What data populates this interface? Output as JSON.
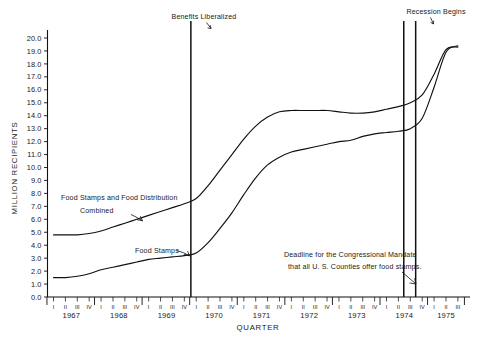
{
  "chart_data": {
    "type": "line",
    "title": "",
    "xlabel": "QUARTER",
    "ylabel": "MILLION RECIPIENTS",
    "ylim": [
      0.0,
      20.0
    ],
    "ytick_step": 1.0,
    "grid": false,
    "legend_position": "inline-annotations",
    "ytick_labels": [
      "0.0",
      "1.0",
      "2.0",
      "3.0",
      "4.0",
      "5.0",
      "6.0",
      "7.0",
      "8.0",
      "9.0",
      "10.0",
      "11.0",
      "12.0",
      "13.0",
      "14.0",
      "15.0",
      "16.0",
      "17.0",
      "18.0",
      "19.0",
      "20.0"
    ],
    "years": [
      "1967",
      "1968",
      "1969",
      "1970",
      "1971",
      "1972",
      "1973",
      "1974",
      "1975"
    ],
    "quarter_labels": [
      "I",
      "II",
      "III",
      "IV"
    ],
    "last_year_quarters": [
      "I",
      "II",
      "III"
    ],
    "x": [
      "1967 I",
      "1967 II",
      "1967 III",
      "1967 IV",
      "1968 I",
      "1968 II",
      "1968 III",
      "1968 IV",
      "1969 I",
      "1969 II",
      "1969 III",
      "1969 IV",
      "1970 I",
      "1970 II",
      "1970 III",
      "1970 IV",
      "1971 I",
      "1971 II",
      "1971 III",
      "1971 IV",
      "1972 I",
      "1972 II",
      "1972 III",
      "1972 IV",
      "1973 I",
      "1973 II",
      "1973 III",
      "1973 IV",
      "1974 I",
      "1974 II",
      "1974 III",
      "1974 IV",
      "1975 I",
      "1975 II",
      "1975 III"
    ],
    "series": [
      {
        "name": "Food Stamps and Food Distribution Combined",
        "values": [
          4.8,
          4.8,
          4.8,
          4.9,
          5.1,
          5.4,
          5.7,
          6.0,
          6.3,
          6.6,
          6.9,
          7.2,
          7.6,
          8.6,
          9.8,
          11.0,
          12.2,
          13.2,
          13.9,
          14.3,
          14.4,
          14.4,
          14.4,
          14.4,
          14.3,
          14.2,
          14.2,
          14.3,
          14.5,
          14.7,
          15.0,
          15.6,
          17.2,
          19.1,
          19.3
        ]
      },
      {
        "name": "Food Stamps",
        "values": [
          1.5,
          1.5,
          1.6,
          1.8,
          2.1,
          2.3,
          2.5,
          2.7,
          2.9,
          3.0,
          3.1,
          3.2,
          3.4,
          4.2,
          5.3,
          6.5,
          7.9,
          9.2,
          10.2,
          10.8,
          11.2,
          11.4,
          11.6,
          11.8,
          12.0,
          12.1,
          12.4,
          12.6,
          12.7,
          12.8,
          13.0,
          13.8,
          16.2,
          18.9,
          19.4
        ]
      }
    ],
    "annotations": [
      {
        "id": "benefits-liberalized",
        "text": "Benefits Liberalized",
        "at": "1969 IV / 1970 I",
        "type": "vertical-event-line"
      },
      {
        "id": "recession-begins",
        "text": "Recession Begins",
        "at": "1974 IV",
        "type": "vertical-event-line"
      },
      {
        "id": "congressional-mandate-deadline",
        "text_line_1": "Deadline for the Congressional Mandate",
        "text_line_2": "that all U. S. Counties offer food stamps.",
        "at": "1974 II / III",
        "type": "vertical-event-line"
      }
    ]
  },
  "colors": {
    "ink": "#111111",
    "background": "#ffffff"
  }
}
